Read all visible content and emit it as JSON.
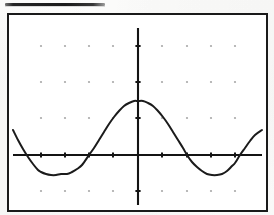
{
  "document": {
    "type": "scanned-worksheet-figure",
    "heading_rule": {
      "name": "heading-underline",
      "x": 5,
      "y": 3,
      "width": 100,
      "height": 3,
      "color": "#1d1d1d"
    }
  },
  "figure": {
    "title": "",
    "caption": "",
    "frame": {
      "x": 7,
      "y": 13,
      "width": 261,
      "height": 199,
      "border_color": "#1a1a1a",
      "border_width": 2,
      "background": "#ffffff"
    }
  },
  "chart_data": {
    "type": "line",
    "title": "",
    "subtitle": "",
    "xlabel": "",
    "ylabel": "",
    "function": "y = A*cos(2*pi*x/T)",
    "amplitude_px": 54,
    "period_px": 146,
    "grid": true,
    "grid_style": "dots",
    "legend": null,
    "legend_position": "none",
    "axes": {
      "x_axis": {
        "pixel_y": 155,
        "x_start": 13,
        "x_end": 262,
        "color": "#141414",
        "visible": true
      },
      "y_axis": {
        "pixel_x": 138,
        "y_start": 28,
        "y_end": 205,
        "color": "#141414",
        "visible": true
      },
      "origin": {
        "x": 138,
        "y": 155
      }
    },
    "grid_dots": {
      "columns_px": [
        41,
        65,
        89,
        113,
        138,
        162,
        187,
        211,
        235
      ],
      "rows_px": [
        46,
        82,
        118,
        191
      ],
      "color": "#8e8e8e",
      "radius_px": 1.1
    },
    "x_ticks_px": [
      41,
      65,
      89,
      113,
      138,
      162,
      187,
      211,
      235
    ],
    "y_ticks_px": [
      46,
      82,
      118,
      191
    ],
    "ylim_px": [
      28,
      205
    ],
    "xlim_px": [
      13,
      262
    ],
    "key_points": [
      {
        "label": "left-endpoint",
        "x": 13,
        "y": 130
      },
      {
        "label": "zero-crossing",
        "x": 41,
        "y": 155
      },
      {
        "label": "left-minimum",
        "x": 67,
        "y": 174
      },
      {
        "label": "zero-crossing",
        "x": 89,
        "y": 155
      },
      {
        "label": "maximum",
        "x": 138,
        "y": 101
      },
      {
        "label": "zero-crossing",
        "x": 187,
        "y": 155
      },
      {
        "label": "right-minimum",
        "x": 212,
        "y": 174
      },
      {
        "label": "zero-crossing",
        "x": 235,
        "y": 155
      },
      {
        "label": "right-endpoint",
        "x": 262,
        "y": 130
      }
    ],
    "series": [
      {
        "name": "cosine-curve",
        "color": "#1b1b1b",
        "stroke_width": 2.0,
        "x": [
          13,
          18,
          23,
          28,
          33,
          38,
          41,
          46,
          51,
          56,
          61,
          67,
          72,
          77,
          82,
          89,
          94,
          99,
          104,
          109,
          114,
          119,
          124,
          129,
          134,
          138,
          143,
          148,
          153,
          158,
          163,
          168,
          173,
          178,
          183,
          187,
          192,
          197,
          202,
          207,
          212,
          217,
          222,
          227,
          232,
          235,
          240,
          245,
          250,
          255,
          262
        ],
        "y": [
          130,
          140,
          149,
          157,
          164,
          170,
          172,
          174,
          175,
          175,
          174,
          174,
          172,
          169,
          165,
          155,
          148,
          140,
          132,
          124,
          117,
          111,
          106,
          103,
          101,
          101,
          101,
          103,
          106,
          111,
          117,
          124,
          132,
          140,
          148,
          155,
          162,
          167,
          171,
          174,
          175,
          175,
          174,
          171,
          166,
          163,
          155,
          148,
          141,
          135,
          130
        ]
      }
    ]
  }
}
